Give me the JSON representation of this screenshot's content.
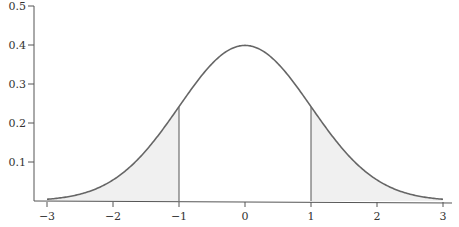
{
  "chart_data": {
    "type": "line",
    "title": "",
    "xlabel": "",
    "ylabel": "",
    "function": "standard normal probability density",
    "xlim": [
      -3,
      3
    ],
    "ylim": [
      0,
      0.5
    ],
    "grid": false,
    "legend": "none",
    "x_ticks": [
      -3,
      -2,
      -1,
      0,
      1,
      2,
      3
    ],
    "x_tick_labels": [
      "−3",
      "−2",
      "−1",
      "0",
      "1",
      "2",
      "3"
    ],
    "y_ticks": [
      0.1,
      0.2,
      0.3,
      0.4,
      0.5
    ],
    "y_tick_labels": [
      "0.1",
      "0.2",
      "0.3",
      "0.4",
      "0.5"
    ],
    "series": [
      {
        "name": "N(0,1) density",
        "x": [
          -3,
          -2.5,
          -2,
          -1.5,
          -1,
          -0.5,
          0,
          0.5,
          1,
          1.5,
          2,
          2.5,
          3
        ],
        "values": [
          0.0044,
          0.0175,
          0.054,
          0.1295,
          0.242,
          0.3521,
          0.3989,
          0.3521,
          0.242,
          0.1295,
          0.054,
          0.0175,
          0.0044
        ]
      }
    ],
    "shaded_regions": [
      {
        "from": -3,
        "to": -1,
        "label": "left tail"
      },
      {
        "from": 1,
        "to": 3,
        "label": "right tail"
      }
    ],
    "vertical_lines": [
      -1,
      1
    ],
    "colors": {
      "curve": "#666666",
      "shade": "#f0f0f0",
      "axis": "#555555"
    }
  }
}
